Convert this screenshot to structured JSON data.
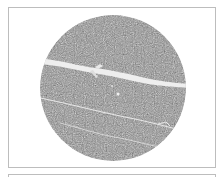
{
  "figure": {
    "panels": [
      {
        "name": "specimen-panel",
        "content": "speckled gray circular sample with one wide crack and thin fissures"
      },
      {
        "name": "next-panel",
        "content": "empty frame (partially visible)"
      }
    ],
    "colors": {
      "specimen_base": "#8e8e8e",
      "specimen_light": "#c8c8c8",
      "crack": "#f2f2f2",
      "frame_border": "#bdbdbd",
      "background": "#ffffff"
    },
    "features": [
      {
        "type": "major-crack",
        "description": "wide bright crack crossing the upper-middle of the sample"
      },
      {
        "type": "fissure",
        "description": "thin crack across the lower-middle"
      },
      {
        "type": "fissure",
        "description": "thin crack near the bottom"
      },
      {
        "type": "inclusion",
        "description": "small bright spot in center"
      }
    ]
  }
}
